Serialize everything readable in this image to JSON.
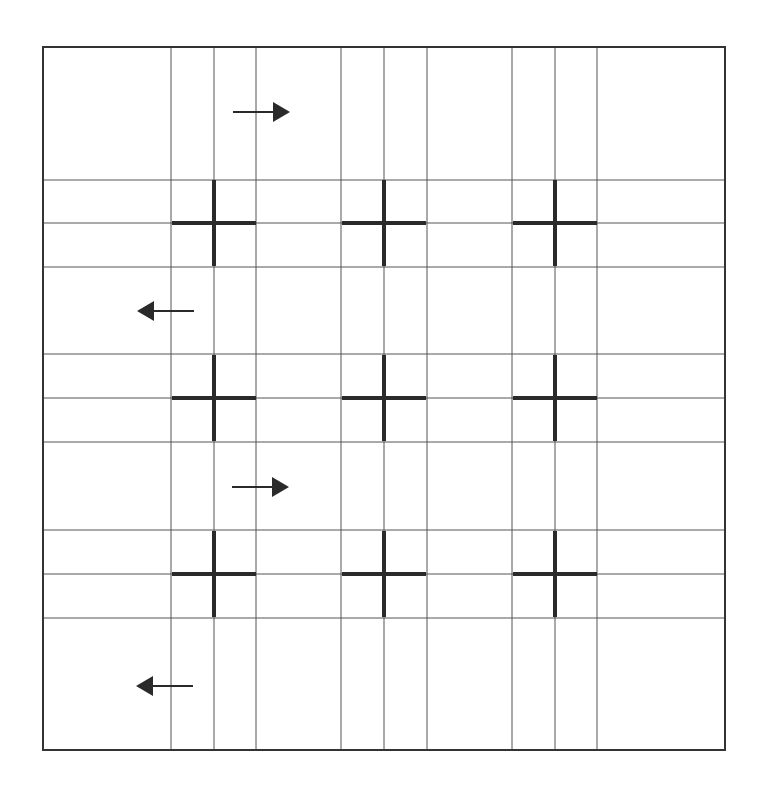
{
  "diagram": {
    "type": "serpentine-grid-path",
    "colors": {
      "background": "#ffffff",
      "border": "#333333",
      "gridline": "#555555",
      "cross": "#2a2a2a",
      "arrow": "#2a2a2a"
    },
    "frame": {
      "left": 43,
      "top": 47,
      "right": 725,
      "bottom": 750
    },
    "vertical_lines": [
      171,
      214,
      256,
      341,
      384,
      427,
      512,
      555,
      597
    ],
    "horizontal_lines": [
      180,
      223,
      267,
      354,
      398,
      442,
      530,
      574,
      618
    ],
    "crosses": [
      {
        "cx": 214,
        "cy": 223
      },
      {
        "cx": 384,
        "cy": 223
      },
      {
        "cx": 555,
        "cy": 223
      },
      {
        "cx": 214,
        "cy": 398
      },
      {
        "cx": 384,
        "cy": 398
      },
      {
        "cx": 555,
        "cy": 398
      },
      {
        "cx": 214,
        "cy": 574
      },
      {
        "cx": 384,
        "cy": 574
      },
      {
        "cx": 555,
        "cy": 574
      }
    ],
    "cross_half_size": 42,
    "arrows": [
      {
        "direction": "right",
        "x1": 233,
        "x2": 290,
        "y": 112
      },
      {
        "direction": "left",
        "x1": 137,
        "x2": 194,
        "y": 311
      },
      {
        "direction": "right",
        "x1": 232,
        "x2": 289,
        "y": 487
      },
      {
        "direction": "left",
        "x1": 136,
        "x2": 193,
        "y": 686
      }
    ]
  }
}
